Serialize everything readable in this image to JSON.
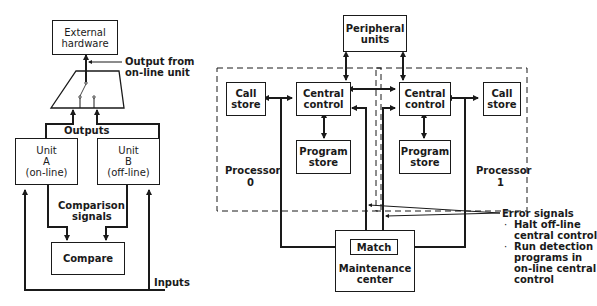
{
  "left_diagram": {
    "external_hardware": "External\nhardware",
    "output_from_online": "Output from\non-line unit",
    "outputs": "Outputs",
    "unit_a": {
      "line1": "Unit",
      "line2": "A",
      "line3": "(on-line)"
    },
    "unit_b": {
      "line1": "Unit",
      "line2": "B",
      "line3": "(off-line)"
    },
    "comparison_signals": {
      "line1": "Comparison",
      "line2": "signals"
    },
    "compare": "Compare",
    "inputs": "Inputs"
  },
  "right_diagram": {
    "peripheral_units": {
      "line1": "Peripheral",
      "line2": "units"
    },
    "processor0": {
      "label_line1": "Processor",
      "label_line2": "0",
      "call_store": {
        "line1": "Call",
        "line2": "store"
      },
      "central_control": {
        "line1": "Central",
        "line2": "control"
      },
      "program_store": {
        "line1": "Program",
        "line2": "store"
      }
    },
    "processor1": {
      "label_line1": "Processor",
      "label_line2": "1",
      "call_store": {
        "line1": "Call",
        "line2": "store"
      },
      "central_control": {
        "line1": "Central",
        "line2": "control"
      },
      "program_store": {
        "line1": "Program",
        "line2": "store"
      }
    },
    "match": "Match",
    "maintenance_center": {
      "line1": "Maintenance",
      "line2": "center"
    },
    "error_signals": {
      "title": "Error signals",
      "bullets": [
        {
          "line1": "Halt off-line",
          "line2": "central control"
        },
        {
          "line1": "Run detection",
          "line2": "programs in",
          "line3": "on-line central",
          "line4": "control"
        }
      ]
    }
  }
}
